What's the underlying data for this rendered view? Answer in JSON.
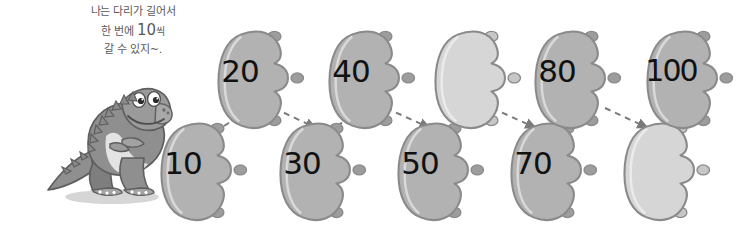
{
  "figure": {
    "kind": "skip-counting-footprints-diagram",
    "background_color": "#ffffff"
  },
  "speech": {
    "line1": "나는 다리가 길어서",
    "line2_pre": "한 번에 ",
    "line2_number": "10",
    "line2_post": "씩",
    "line3": "갈 수 있지~.",
    "text_color": "#5a5a5a"
  },
  "character": {
    "name": "dinosaur",
    "label": "회색 공룡",
    "facing": "right",
    "body_color": "#8f8f8f",
    "belly_color": "#e3e3e3",
    "outline_color": "#5e5e5e",
    "eye_white": "#ffffff",
    "eye_pupil": "#2b2b2b"
  },
  "colors": {
    "footprint_filled": "#b2b2b2",
    "footprint_filled_shade": "#9d9d9d",
    "footprint_empty": "#d6d6d6",
    "footprint_empty_shade": "#c7c7c7",
    "footprint_outline": "#8a8a8a",
    "arrow": "#7a7a7a",
    "number": "#111111"
  },
  "chart_data": {
    "type": "diagram",
    "sequence_step": 10,
    "rows": {
      "top": [
        "20",
        "40",
        "",
        "80",
        "100"
      ],
      "bottom": [
        "10",
        "30",
        "50",
        "70",
        ""
      ]
    },
    "order": [
      "10",
      "20",
      "30",
      "40",
      "50",
      "",
      "70",
      "80",
      "",
      "100"
    ],
    "blanks": 2
  },
  "footprints": {
    "bottom": [
      {
        "id": "print-10",
        "label": "10",
        "empty": false,
        "x": 146,
        "y": 116
      },
      {
        "id": "print-30",
        "label": "30",
        "empty": false,
        "x": 265,
        "y": 116
      },
      {
        "id": "print-50",
        "label": "50",
        "empty": false,
        "x": 383,
        "y": 116
      },
      {
        "id": "print-70",
        "label": "70",
        "empty": false,
        "x": 496,
        "y": 116
      },
      {
        "id": "print-90",
        "label": "",
        "empty": true,
        "x": 609,
        "y": 116
      }
    ],
    "top": [
      {
        "id": "print-20",
        "label": "20",
        "empty": false,
        "x": 203,
        "y": 24
      },
      {
        "id": "print-40",
        "label": "40",
        "empty": false,
        "x": 314,
        "y": 24
      },
      {
        "id": "print-60",
        "label": "",
        "empty": true,
        "x": 420,
        "y": 24
      },
      {
        "id": "print-80",
        "label": "80",
        "empty": false,
        "x": 520,
        "y": 24
      },
      {
        "id": "print-100",
        "label": "100",
        "empty": false,
        "x": 632,
        "y": 24
      }
    ]
  },
  "arrows": {
    "count": 9,
    "style": "dashed",
    "paths": [
      {
        "from": "print-10",
        "to": "print-20",
        "x1": 224,
        "y1": 126,
        "x2": 258,
        "y2": 104
      },
      {
        "from": "print-20",
        "to": "print-30",
        "x1": 274,
        "y1": 108,
        "x2": 316,
        "y2": 128
      },
      {
        "from": "print-30",
        "to": "print-40",
        "x1": 337,
        "y1": 126,
        "x2": 370,
        "y2": 104
      },
      {
        "from": "print-40",
        "to": "print-50",
        "x1": 386,
        "y1": 108,
        "x2": 430,
        "y2": 128
      },
      {
        "from": "print-50",
        "to": "print-60",
        "x1": 452,
        "y1": 126,
        "x2": 480,
        "y2": 104
      },
      {
        "from": "print-60",
        "to": "print-70",
        "x1": 492,
        "y1": 108,
        "x2": 536,
        "y2": 128
      },
      {
        "from": "print-70",
        "to": "print-80",
        "x1": 562,
        "y1": 126,
        "x2": 592,
        "y2": 104
      },
      {
        "from": "print-80",
        "to": "print-90",
        "x1": 605,
        "y1": 108,
        "x2": 648,
        "y2": 128
      },
      {
        "from": "print-90",
        "to": "print-100",
        "x1": 676,
        "y1": 126,
        "x2": 706,
        "y2": 104
      }
    ]
  }
}
